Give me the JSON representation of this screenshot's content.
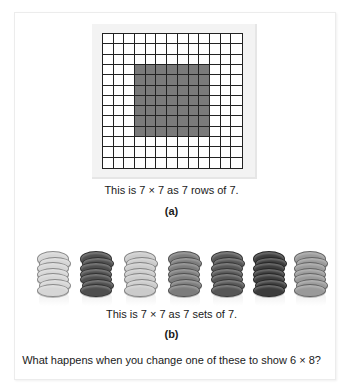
{
  "figure_a": {
    "grid": {
      "rows": 13,
      "cols": 13,
      "shaded": {
        "row_start": 3,
        "row_count": 7,
        "col_start": 3,
        "col_count": 7
      },
      "line_color": "#222222",
      "shade_color": "#7a7a7a"
    },
    "caption": "This is 7 × 7 as 7 rows of 7.",
    "label": "(a)"
  },
  "figure_b": {
    "stacks": [
      {
        "color": "#d6d6d6",
        "coins": 7,
        "x": 37
      },
      {
        "color": "#4e4e4e",
        "coins": 7,
        "x": 80
      },
      {
        "color": "#cbcbcb",
        "coins": 7,
        "x": 124
      },
      {
        "color": "#7c7c7c",
        "coins": 7,
        "x": 168
      },
      {
        "color": "#565656",
        "coins": 7,
        "x": 211
      },
      {
        "color": "#3c3c3c",
        "coins": 7,
        "x": 253
      },
      {
        "color": "#9a9a9a",
        "coins": 7,
        "x": 294
      }
    ],
    "caption": "This is 7 × 7 as 7 sets of 7.",
    "label": "(b)"
  },
  "question": "What happens when you change one of these to show 6 × 8?"
}
